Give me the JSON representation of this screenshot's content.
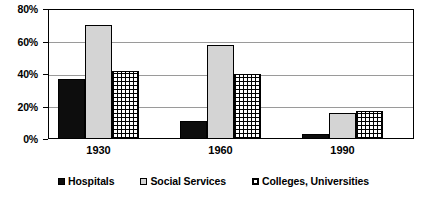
{
  "chart_data": {
    "type": "bar",
    "title": "",
    "subtitle": "",
    "xlabel": "",
    "ylabel": "",
    "categories": [
      "1930",
      "1960",
      "1990"
    ],
    "series": [
      {
        "name": "Hospitals",
        "values": [
          37,
          11,
          3
        ],
        "color": "#0d0d0d",
        "pattern": "solid-black"
      },
      {
        "name": "Social Services",
        "values": [
          70,
          58,
          16
        ],
        "color": "#d4d4d4",
        "pattern": "solid-light-gray"
      },
      {
        "name": "Colleges, Universities",
        "values": [
          42,
          40,
          17
        ],
        "color": "#ffffff",
        "pattern": "checkered"
      }
    ],
    "ylim": [
      0,
      80
    ],
    "yticks": [
      0,
      20,
      40,
      60,
      80
    ],
    "ytick_labels": [
      "0%",
      "20%",
      "40%",
      "60%",
      "80%"
    ],
    "grid": true,
    "grid_axis": "y",
    "legend_position": "bottom",
    "value_format": "percent"
  }
}
